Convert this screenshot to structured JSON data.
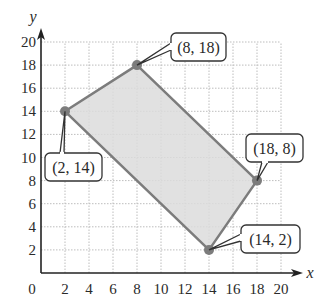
{
  "figure": {
    "type": "coordinate-plane-polygon",
    "x_axis": {
      "label": "x",
      "min": 0,
      "max": 20,
      "ticks": [
        2,
        4,
        6,
        8,
        10,
        12,
        14,
        16,
        18,
        20
      ],
      "tick_labels": [
        "2",
        "4",
        "6",
        "8",
        "10",
        "12",
        "14",
        "16",
        "18",
        "20"
      ]
    },
    "y_axis": {
      "label": "y",
      "min": 0,
      "max": 20,
      "ticks": [
        2,
        4,
        6,
        8,
        10,
        12,
        14,
        16,
        18,
        20
      ],
      "tick_labels": [
        "2",
        "4",
        "6",
        "8",
        "10",
        "12",
        "14",
        "16",
        "18",
        "20"
      ]
    },
    "origin_label": "0",
    "grid": {
      "enabled": true,
      "step": 2,
      "style": "dotted"
    },
    "polygon": {
      "vertices": [
        {
          "x": 2,
          "y": 14,
          "label": "(2, 14)"
        },
        {
          "x": 8,
          "y": 18,
          "label": "(8, 18)"
        },
        {
          "x": 18,
          "y": 8,
          "label": "(18, 8)"
        },
        {
          "x": 14,
          "y": 2,
          "label": "(14, 2)"
        }
      ],
      "fill_color": "#dcdcdc",
      "stroke_color": "#7c7c7c",
      "point_color": "#7c7c7c"
    },
    "colors": {
      "axis": "#222222",
      "grid": "#bdbdbd",
      "callout_border": "#333333",
      "text": "#2a2a2a"
    }
  }
}
